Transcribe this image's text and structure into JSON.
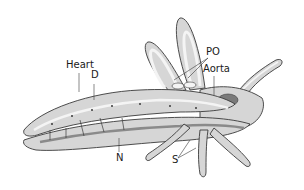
{
  "diagram": {
    "colors": {
      "background": "#ffffff",
      "body_fill": "#d6d6d6",
      "outline": "#3a3a3a",
      "vessel_fill": "#f4f4f4",
      "dark_organ": "#7a7a7a"
    },
    "labels": {
      "heart": "Heart",
      "d": "D",
      "po": "PO",
      "aorta": "Aorta",
      "n": "N",
      "s": "S"
    }
  }
}
